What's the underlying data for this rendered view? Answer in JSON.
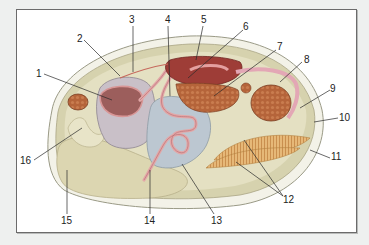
{
  "diagram": {
    "labels": [
      {
        "id": "1",
        "text": "1",
        "x": 36,
        "y": 69
      },
      {
        "id": "2",
        "text": "2",
        "x": 77,
        "y": 34
      },
      {
        "id": "3",
        "text": "3",
        "x": 129,
        "y": 15
      },
      {
        "id": "4",
        "text": "4",
        "x": 165,
        "y": 15
      },
      {
        "id": "5",
        "text": "5",
        "x": 201,
        "y": 15
      },
      {
        "id": "6",
        "text": "6",
        "x": 243,
        "y": 22
      },
      {
        "id": "7",
        "text": "7",
        "x": 277,
        "y": 42
      },
      {
        "id": "8",
        "text": "8",
        "x": 304,
        "y": 55
      },
      {
        "id": "9",
        "text": "9",
        "x": 330,
        "y": 84
      },
      {
        "id": "10",
        "text": "10",
        "x": 339,
        "y": 113
      },
      {
        "id": "11",
        "text": "11",
        "x": 331,
        "y": 152
      },
      {
        "id": "12",
        "text": "12",
        "x": 283,
        "y": 195
      },
      {
        "id": "13",
        "text": "13",
        "x": 211,
        "y": 216
      },
      {
        "id": "14",
        "text": "14",
        "x": 144,
        "y": 216
      },
      {
        "id": "15",
        "text": "15",
        "x": 61,
        "y": 216
      },
      {
        "id": "16",
        "text": "16",
        "x": 20,
        "y": 156
      }
    ]
  },
  "colors": {
    "background": "#eef0ef",
    "frame": "#ffffff",
    "shell": "#f1f0e6",
    "mantle": "#cdc9a3",
    "foot": "#ddd8b6",
    "gonad": "#b8c4cf",
    "stomach": "#c7bfc6",
    "intestine": "#e5a9a9",
    "heart": "#a8403a",
    "muscle": "#b3663d",
    "gill": "#e2b274"
  }
}
